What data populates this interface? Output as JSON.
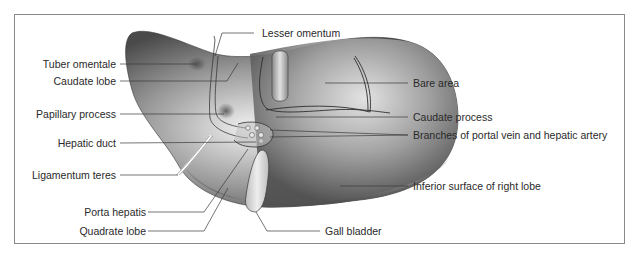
{
  "figure": {
    "colors": {
      "border": "#8a8a8a",
      "leader_line": "#3a3a3a",
      "liver_dark": "#4a4a4a",
      "liver_light": "#e6e6e6",
      "text": "#2a2a2a"
    },
    "labels_left": [
      {
        "text": "Tuber omentale"
      },
      {
        "text": "Caudate lobe"
      },
      {
        "text": "Papillary process"
      },
      {
        "text": "Hepatic duct"
      },
      {
        "text": "Ligamentum teres"
      },
      {
        "text": "Porta hepatis"
      },
      {
        "text": "Quadrate lobe"
      }
    ],
    "labels_top": [
      {
        "text": "Lesser omentum"
      }
    ],
    "labels_right": [
      {
        "text": "Bare area"
      },
      {
        "text": "Caudate process"
      },
      {
        "text": "Branches of portal vein and hepatic artery"
      },
      {
        "text": "Inferior surface of right lobe"
      }
    ],
    "labels_bottom": [
      {
        "text": "Gall bladder"
      }
    ]
  }
}
